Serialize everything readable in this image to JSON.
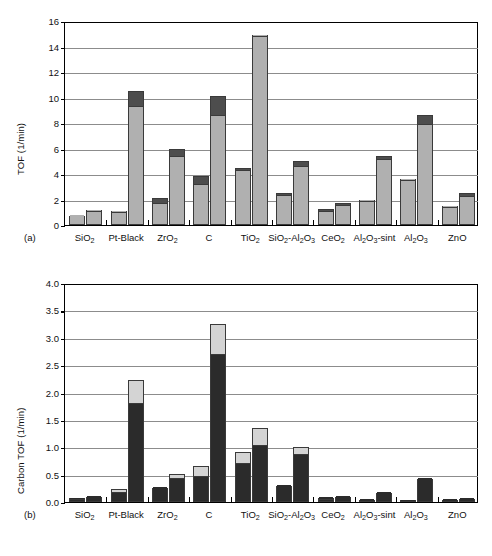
{
  "figure": {
    "panels": [
      {
        "tag": "(a)",
        "ylabel": "TOF (1/min)",
        "yticks": [
          "0",
          "2",
          "4",
          "6",
          "8",
          "10",
          "12",
          "14",
          "16"
        ]
      },
      {
        "tag": "(b)",
        "ylabel": "Carbon TOF (1/min)",
        "yticks": [
          "0.0",
          "0.5",
          "1.0",
          "1.5",
          "2.0",
          "2.5",
          "3.0",
          "3.5",
          "4.0"
        ]
      }
    ]
  },
  "categories": [
    {
      "text": "SiO",
      "sub": "2",
      "tail": ""
    },
    {
      "text": "Pt-Black",
      "sub": "",
      "tail": ""
    },
    {
      "text": "ZrO",
      "sub": "2",
      "tail": ""
    },
    {
      "text": "C",
      "sub": "",
      "tail": ""
    },
    {
      "text": "TiO",
      "sub": "2",
      "tail": ""
    },
    {
      "text": "SiO",
      "sub": "2",
      "tail": "-Al2O3"
    },
    {
      "text": "CeO",
      "sub": "2",
      "tail": ""
    },
    {
      "text": "Al2O3",
      "sub": "",
      "tail": "-sint"
    },
    {
      "text": "Al2O3",
      "sub": "",
      "tail": ""
    },
    {
      "text": "ZnO",
      "sub": "",
      "tail": ""
    }
  ],
  "colors": {
    "light_gray": "#b0b0b0",
    "dark_gray": "#4d4d4d",
    "black": "#2b2b2b",
    "pale_gray": "#d4d4d4",
    "axis": "#000000",
    "grid": "#8c8c8c"
  },
  "chart_data": [
    {
      "type": "bar",
      "panel": "(a)",
      "title": "",
      "xlabel": "",
      "ylabel": "TOF (1/min)",
      "ylim": [
        0,
        16
      ],
      "ytick_step": 2,
      "grid": true,
      "stacked": true,
      "bars_per_group": 2,
      "segment_names": [
        "lower (light gray)",
        "upper (dark gray)"
      ],
      "categories": [
        "SiO2",
        "Pt-Black",
        "ZrO2",
        "C",
        "TiO2",
        "SiO2-Al2O3",
        "CeO2",
        "Al2O3-sint",
        "Al2O3",
        "ZnO"
      ],
      "series": [
        {
          "name": "bar 1 - lower segment",
          "values": [
            0.7,
            1.0,
            1.75,
            3.2,
            4.3,
            2.35,
            1.1,
            1.85,
            3.55,
            1.4
          ]
        },
        {
          "name": "bar 1 - total",
          "values": [
            0.7,
            1.1,
            2.1,
            3.85,
            4.5,
            2.5,
            1.25,
            1.95,
            3.6,
            1.5
          ]
        },
        {
          "name": "bar 2 - lower segment",
          "values": [
            1.1,
            9.35,
            5.4,
            8.6,
            14.85,
            4.65,
            1.55,
            5.15,
            7.95,
            2.3
          ]
        },
        {
          "name": "bar 2 - total",
          "values": [
            1.15,
            10.55,
            6.0,
            10.15,
            14.9,
            5.05,
            1.75,
            5.45,
            8.6,
            2.55
          ]
        }
      ]
    },
    {
      "type": "bar",
      "panel": "(b)",
      "title": "",
      "xlabel": "",
      "ylabel": "Carbon TOF (1/min)",
      "ylim": [
        0,
        4.0
      ],
      "ytick_step": 0.5,
      "grid": true,
      "stacked": true,
      "bars_per_group": 2,
      "segment_names": [
        "lower (black)",
        "upper (pale gray)"
      ],
      "categories": [
        "SiO2",
        "Pt-Black",
        "ZrO2",
        "C",
        "TiO2",
        "SiO2-Al2O3",
        "CeO2",
        "Al2O3-sint",
        "Al2O3",
        "ZnO"
      ],
      "series": [
        {
          "name": "bar 1 - lower segment",
          "values": [
            0.05,
            0.19,
            0.26,
            0.47,
            0.72,
            0.29,
            0.07,
            0.03,
            0.02,
            0.04
          ]
        },
        {
          "name": "bar 1 - total",
          "values": [
            0.07,
            0.24,
            0.26,
            0.66,
            0.91,
            0.29,
            0.08,
            0.04,
            0.02,
            0.04
          ]
        },
        {
          "name": "bar 2 - lower segment",
          "values": [
            0.09,
            1.8,
            0.43,
            2.7,
            1.04,
            0.87,
            0.1,
            0.16,
            0.42,
            0.06
          ]
        },
        {
          "name": "bar 2 - total",
          "values": [
            0.09,
            2.23,
            0.51,
            3.25,
            1.36,
            1.0,
            0.1,
            0.16,
            0.42,
            0.06
          ]
        }
      ]
    }
  ]
}
